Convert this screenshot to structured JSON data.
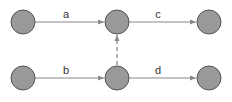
{
  "diagram": {
    "type": "directed-graph",
    "colors": {
      "node_fill": "#999999",
      "node_stroke": "#555555",
      "edge": "#888888",
      "label": "#333333"
    },
    "nodes": [
      {
        "id": "n1",
        "x": 23,
        "y": 22
      },
      {
        "id": "n2",
        "x": 117,
        "y": 22
      },
      {
        "id": "n3",
        "x": 209,
        "y": 22
      },
      {
        "id": "n4",
        "x": 23,
        "y": 78
      },
      {
        "id": "n5",
        "x": 117,
        "y": 78
      },
      {
        "id": "n6",
        "x": 209,
        "y": 78
      }
    ],
    "edges": [
      {
        "from": "n1",
        "to": "n2",
        "label": "a",
        "style": "solid"
      },
      {
        "from": "n4",
        "to": "n5",
        "label": "b",
        "style": "solid"
      },
      {
        "from": "n2",
        "to": "n3",
        "label": "c",
        "style": "solid"
      },
      {
        "from": "n5",
        "to": "n6",
        "label": "d",
        "style": "solid"
      },
      {
        "from": "n5",
        "to": "n2",
        "label": "",
        "style": "dashed"
      }
    ]
  }
}
